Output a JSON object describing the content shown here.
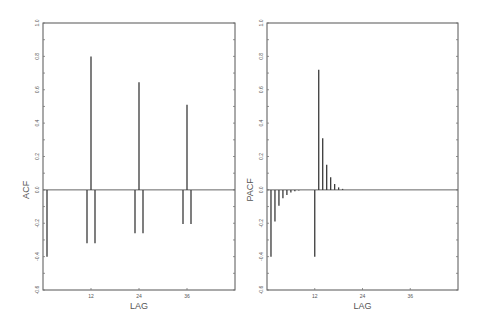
{
  "chart_data": [
    {
      "type": "bar",
      "title": "",
      "xlabel": "LAG",
      "ylabel": "ACF",
      "ylim": [
        -0.6,
        1.0
      ],
      "xlim": [
        0,
        48
      ],
      "yticks": [
        -0.6,
        -0.4,
        -0.2,
        0.0,
        0.2,
        0.4,
        0.6,
        0.8,
        1.0
      ],
      "ytick_labels": [
        "-0.6",
        "-0.4",
        "-0.2",
        "0.0",
        "0.2",
        "0.4",
        "0.6",
        "0.8",
        "1.0"
      ],
      "xticks": [
        12,
        24,
        36
      ],
      "xtick_labels": [
        "12",
        "24",
        "36"
      ],
      "grid": false,
      "x": [
        1,
        11,
        12,
        13,
        23,
        24,
        25,
        35,
        36,
        37
      ],
      "values": [
        -0.4,
        -0.32,
        0.8,
        -0.32,
        -0.26,
        0.645,
        -0.26,
        -0.205,
        0.51,
        -0.205
      ]
    },
    {
      "type": "bar",
      "title": "",
      "xlabel": "LAG",
      "ylabel": "PACF",
      "ylim": [
        -0.6,
        1.0
      ],
      "xlim": [
        0,
        48
      ],
      "yticks": [
        -0.6,
        -0.4,
        -0.2,
        0.0,
        0.2,
        0.4,
        0.6,
        0.8,
        1.0
      ],
      "ytick_labels": [
        "-0.6",
        "-0.4",
        "-0.2",
        "0.0",
        "0.2",
        "0.4",
        "0.6",
        "0.8",
        "1.0"
      ],
      "xticks": [
        12,
        24,
        36
      ],
      "xtick_labels": [
        "12",
        "24",
        "36"
      ],
      "grid": false,
      "x": [
        1,
        2,
        3,
        4,
        5,
        6,
        7,
        8,
        12,
        13,
        14,
        15,
        16,
        17,
        18,
        19
      ],
      "values": [
        -0.4,
        -0.19,
        -0.095,
        -0.05,
        -0.03,
        -0.015,
        -0.008,
        -0.004,
        -0.4,
        0.72,
        0.31,
        0.15,
        0.075,
        0.035,
        0.015,
        0.006
      ]
    }
  ],
  "panels": [
    {
      "xlabel": "LAG",
      "ylabel": "ACF"
    },
    {
      "xlabel": "LAG",
      "ylabel": "PACF"
    }
  ]
}
